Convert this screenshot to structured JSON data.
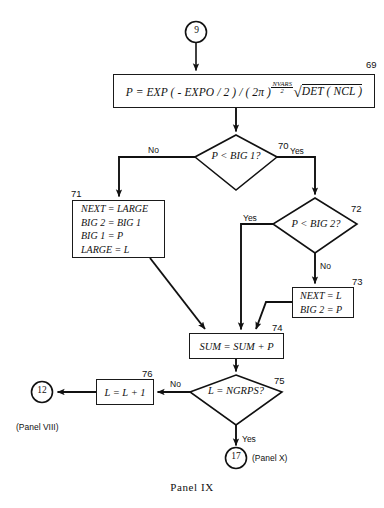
{
  "figure": {
    "caption": "Panel IX",
    "colors": {
      "ink": "#111111",
      "background": "#ffffff"
    }
  },
  "connectors": {
    "entry": {
      "id": "9",
      "step": ""
    },
    "exit_left": {
      "id": "12",
      "panel_ref": "(Panel VIII)"
    },
    "exit_bottom": {
      "id": "17",
      "panel_ref": "(Panel X)"
    }
  },
  "nodes": {
    "n69": {
      "step": "69",
      "type": "process",
      "formula": {
        "lhs": "P  =  EXP ( - EXPO / 2 ) / ( 2π )",
        "exponent_num": "NVARS",
        "exponent_den": "2",
        "radical": "DET ( NCL )",
        "plain": "P = EXP(-EXPO/2)/(2π)^(NVARS/2) √DET(NCL)"
      }
    },
    "n70": {
      "step": "70",
      "type": "decision",
      "text": "P  <  BIG 1?",
      "branch_no": "No",
      "branch_yes": "Yes"
    },
    "n71": {
      "step": "71",
      "type": "process",
      "lines": [
        "NEXT  =  LARGE",
        "BIG 2  =  BIG 1",
        "BIG 1  =  P",
        "LARGE  =  L"
      ]
    },
    "n72": {
      "step": "72",
      "type": "decision",
      "text": "P  <  BIG 2?",
      "branch_yes": "Yes",
      "branch_no": "No"
    },
    "n73": {
      "step": "73",
      "type": "process",
      "lines": [
        "NEXT  =  L",
        "BIG 2  =  P"
      ]
    },
    "n74": {
      "step": "74",
      "type": "process",
      "text": "SUM  =  SUM  +  P"
    },
    "n75": {
      "step": "75",
      "type": "decision",
      "text": "L  =  NGRPS?",
      "branch_no": "No",
      "branch_yes": "Yes"
    },
    "n76": {
      "step": "76",
      "type": "process",
      "text": "L  =  L  +  1"
    }
  }
}
